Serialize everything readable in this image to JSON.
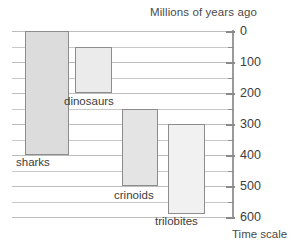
{
  "chart_data": {
    "type": "bar",
    "orientation": "vertical-range",
    "title": "Millions of years ago",
    "xlabel": "",
    "ylabel": "Time scale",
    "ylim": [
      0,
      600
    ],
    "y_inverted": true,
    "grid": true,
    "legend": "none",
    "y_ticks": [
      0,
      100,
      200,
      300,
      400,
      500,
      600
    ],
    "y_tick_labels": [
      "0",
      "100",
      "200",
      "300",
      "400",
      "500",
      "600"
    ],
    "y_minor_ticks": [
      50,
      150,
      250,
      350,
      450,
      550
    ],
    "categories": [
      "sharks",
      "dinosaurs",
      "crinoids",
      "trilobites"
    ],
    "bars": [
      {
        "name": "sharks",
        "start": 0,
        "end": 400,
        "color": "#dcdcdc"
      },
      {
        "name": "dinosaurs",
        "start": 50,
        "end": 200,
        "color": "#ebebeb"
      },
      {
        "name": "crinoids",
        "start": 250,
        "end": 500,
        "color": "#e4e4e4"
      },
      {
        "name": "trilobites",
        "start": 300,
        "end": 590,
        "color": "#f1f1f1"
      }
    ]
  },
  "labels": {
    "title": "Millions of years ago",
    "caption": "Time scale",
    "bar_sharks": "sharks",
    "bar_dinosaurs": "dinosaurs",
    "bar_crinoids": "crinoids",
    "bar_trilobites": "trilobites",
    "tick_0": "0",
    "tick_100": "100",
    "tick_200": "200",
    "tick_300": "300",
    "tick_400": "400",
    "tick_500": "500",
    "tick_600": "600"
  },
  "colors": {
    "grid": "#c9c9c9",
    "axis": "#9a9a9a",
    "bar_border": "#8c8c8c",
    "text": "#3d3d3d"
  }
}
